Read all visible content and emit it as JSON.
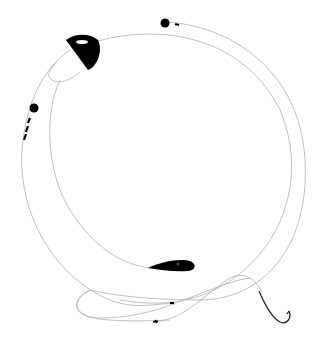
{
  "scene": {
    "description": "Fishing tackle illustration: looped fishing lines with a float, sinkers, swivels, and a hook",
    "background": "#ffffff",
    "line_color": "#b8b8b8",
    "object_color": "#000000",
    "hook_color": "#222222"
  },
  "objects": [
    {
      "name": "float",
      "kind": "bobber"
    },
    {
      "name": "sinker-top",
      "kind": "round-sinker"
    },
    {
      "name": "sinker-left",
      "kind": "round-sinker"
    },
    {
      "name": "swivel-left",
      "kind": "swivel"
    },
    {
      "name": "teardrop-sinker",
      "kind": "sinker"
    },
    {
      "name": "hook",
      "kind": "fish-hook"
    }
  ]
}
